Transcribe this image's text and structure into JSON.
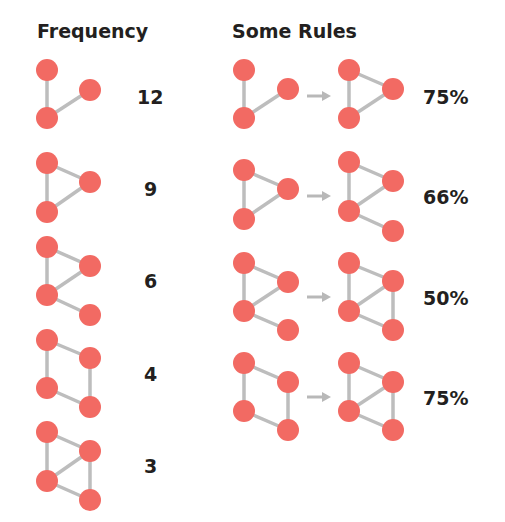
{
  "titles": {
    "frequency": "Frequency",
    "rules": "Some Rules"
  },
  "colors": {
    "node": "#f26a63",
    "edge": "#bdbdbd",
    "arrow": "#b8b8b8",
    "text": "#231f20"
  },
  "frequency": [
    {
      "label": "12",
      "label_y": 97,
      "nodes": [
        [
          47,
          70
        ],
        [
          90,
          90
        ],
        [
          47,
          118
        ]
      ],
      "edges": [
        [
          0,
          2
        ],
        [
          2,
          1
        ]
      ]
    },
    {
      "label": "9",
      "label_y": 189,
      "nodes": [
        [
          47,
          163
        ],
        [
          90,
          182
        ],
        [
          47,
          212
        ]
      ],
      "edges": [
        [
          0,
          1
        ],
        [
          0,
          2
        ],
        [
          2,
          1
        ]
      ]
    },
    {
      "label": "6",
      "label_y": 281,
      "nodes": [
        [
          47,
          247
        ],
        [
          90,
          266
        ],
        [
          47,
          295
        ],
        [
          90,
          315
        ]
      ],
      "edges": [
        [
          0,
          1
        ],
        [
          0,
          2
        ],
        [
          2,
          1
        ],
        [
          2,
          3
        ]
      ]
    },
    {
      "label": "4",
      "label_y": 374,
      "nodes": [
        [
          47,
          340
        ],
        [
          90,
          358
        ],
        [
          47,
          388
        ],
        [
          90,
          407
        ]
      ],
      "edges": [
        [
          0,
          1
        ],
        [
          0,
          2
        ],
        [
          1,
          3
        ],
        [
          2,
          3
        ]
      ]
    },
    {
      "label": "3",
      "label_y": 466,
      "nodes": [
        [
          47,
          432
        ],
        [
          90,
          451
        ],
        [
          47,
          481
        ],
        [
          90,
          500
        ]
      ],
      "edges": [
        [
          0,
          1
        ],
        [
          0,
          2
        ],
        [
          2,
          1
        ],
        [
          1,
          3
        ],
        [
          2,
          3
        ]
      ]
    }
  ],
  "rules": [
    {
      "label": "75%",
      "label_y": 97,
      "arrow_y": 96,
      "left": {
        "nodes": [
          [
            244,
            70
          ],
          [
            288,
            89
          ],
          [
            244,
            118
          ]
        ],
        "edges": [
          [
            0,
            2
          ],
          [
            2,
            1
          ]
        ]
      },
      "right": {
        "nodes": [
          [
            349,
            70
          ],
          [
            393,
            89
          ],
          [
            349,
            118
          ]
        ],
        "edges": [
          [
            0,
            1
          ],
          [
            0,
            2
          ],
          [
            2,
            1
          ]
        ]
      }
    },
    {
      "label": "66%",
      "label_y": 197,
      "arrow_y": 196,
      "left": {
        "nodes": [
          [
            244,
            170
          ],
          [
            288,
            189
          ],
          [
            244,
            219
          ]
        ],
        "edges": [
          [
            0,
            1
          ],
          [
            0,
            2
          ],
          [
            2,
            1
          ]
        ]
      },
      "right": {
        "nodes": [
          [
            349,
            162
          ],
          [
            393,
            181
          ],
          [
            349,
            211
          ],
          [
            393,
            231
          ]
        ],
        "edges": [
          [
            0,
            1
          ],
          [
            0,
            2
          ],
          [
            2,
            1
          ],
          [
            2,
            3
          ]
        ]
      }
    },
    {
      "label": "50%",
      "label_y": 298,
      "arrow_y": 297,
      "left": {
        "nodes": [
          [
            244,
            263
          ],
          [
            288,
            282
          ],
          [
            244,
            311
          ],
          [
            288,
            330
          ]
        ],
        "edges": [
          [
            0,
            1
          ],
          [
            0,
            2
          ],
          [
            2,
            1
          ],
          [
            2,
            3
          ]
        ]
      },
      "right": {
        "nodes": [
          [
            349,
            263
          ],
          [
            393,
            281
          ],
          [
            349,
            311
          ],
          [
            393,
            330
          ]
        ],
        "edges": [
          [
            0,
            1
          ],
          [
            0,
            2
          ],
          [
            2,
            1
          ],
          [
            1,
            3
          ],
          [
            2,
            3
          ]
        ]
      }
    },
    {
      "label": "75%",
      "label_y": 398,
      "arrow_y": 397,
      "left": {
        "nodes": [
          [
            244,
            363
          ],
          [
            288,
            382
          ],
          [
            244,
            411
          ],
          [
            288,
            430
          ]
        ],
        "edges": [
          [
            0,
            1
          ],
          [
            0,
            2
          ],
          [
            1,
            3
          ],
          [
            2,
            3
          ]
        ]
      },
      "right": {
        "nodes": [
          [
            349,
            363
          ],
          [
            393,
            382
          ],
          [
            349,
            411
          ],
          [
            393,
            430
          ]
        ],
        "edges": [
          [
            0,
            1
          ],
          [
            0,
            2
          ],
          [
            2,
            1
          ],
          [
            1,
            3
          ],
          [
            2,
            3
          ]
        ]
      }
    }
  ]
}
